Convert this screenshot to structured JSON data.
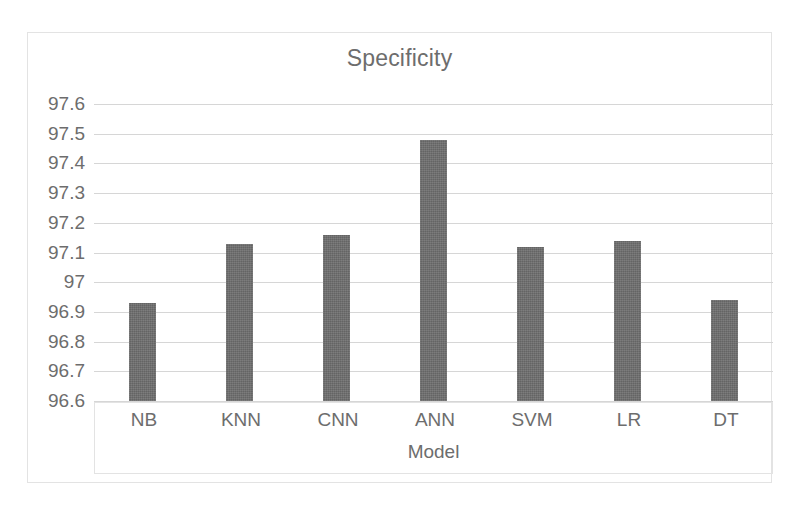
{
  "chart_data": {
    "type": "bar",
    "title": "Specificity",
    "xlabel": "Model",
    "ylabel": "",
    "categories": [
      "NB",
      "KNN",
      "CNN",
      "ANN",
      "SVM",
      "LR",
      "DT"
    ],
    "values": [
      96.93,
      97.13,
      97.16,
      97.48,
      97.12,
      97.14,
      96.94
    ],
    "ylim": [
      96.6,
      97.6
    ],
    "ytick_step": 0.1,
    "yticks": [
      "97.6",
      "97.5",
      "97.4",
      "97.3",
      "97.2",
      "97.1",
      "97",
      "96.9",
      "96.8",
      "96.7",
      "96.6"
    ],
    "ytick_values": [
      97.6,
      97.5,
      97.4,
      97.3,
      97.2,
      97.1,
      97.0,
      96.9,
      96.8,
      96.7,
      96.6
    ],
    "grid": true,
    "legend": false,
    "legend_position": "none",
    "series": [
      {
        "name": "Specificity",
        "values": [
          96.93,
          97.13,
          97.16,
          97.48,
          97.12,
          97.14,
          96.94
        ]
      }
    ],
    "colors": {
      "bar": "#6e6e6e",
      "gridline": "#d6d6d6",
      "text": "#6d6d6d",
      "border": "#e3e3e3",
      "background": "#ffffff"
    }
  }
}
